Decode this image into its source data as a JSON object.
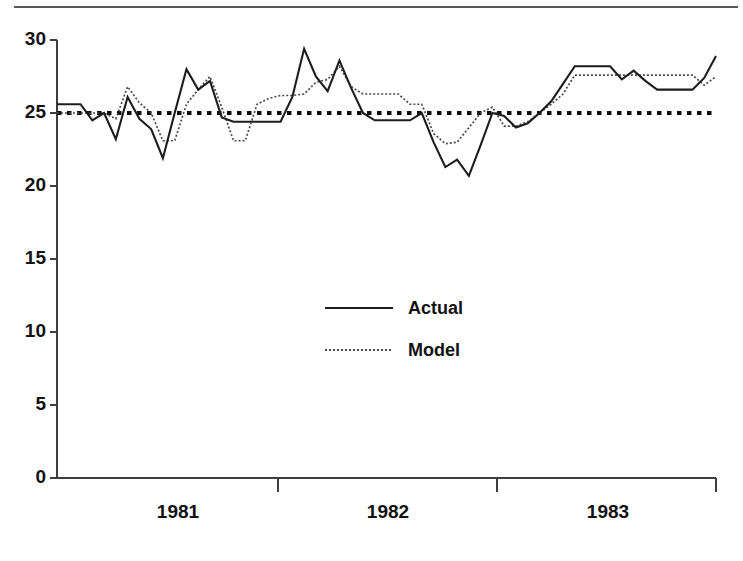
{
  "chart_data": {
    "type": "line",
    "title": "",
    "subtitle": "",
    "xlabel": "",
    "ylabel": "",
    "ylim": [
      0,
      30
    ],
    "yticks": [
      0,
      5,
      10,
      15,
      20,
      25,
      30
    ],
    "ytick_labels": [
      "0",
      "5",
      "10",
      "15",
      "20",
      "25",
      "30"
    ],
    "xtick_labels": [
      "1981",
      "1982",
      "1983"
    ],
    "x_axis_note": "monthly observations spanning late 1980 through early 1984; year tick marks delimit 1981, 1982, 1983",
    "grid": false,
    "legend_position": "center",
    "reference_line": {
      "name": "reference-level",
      "value": 25,
      "style": "dotted-heavy"
    },
    "series": [
      {
        "name": "Actual",
        "style": "solid",
        "color": "#1d1d1d",
        "values": [
          25.6,
          25.6,
          25.6,
          24.5,
          25.0,
          23.2,
          26.1,
          24.6,
          23.9,
          21.9,
          25.0,
          28.0,
          26.6,
          27.2,
          24.7,
          24.4,
          24.4,
          24.4,
          24.4,
          24.4,
          26.1,
          29.4,
          27.5,
          26.5,
          28.6,
          26.7,
          25.0,
          24.5,
          24.5,
          24.5,
          24.5,
          25.0,
          23.0,
          21.3,
          21.8,
          20.7,
          22.8,
          25.0,
          24.8,
          24.0,
          24.3,
          25.0,
          25.8,
          27.0,
          28.2,
          28.2,
          28.2,
          28.2,
          27.3,
          27.9,
          27.2,
          26.6,
          26.6,
          26.6,
          26.6,
          27.4,
          28.9
        ]
      },
      {
        "name": "Model",
        "style": "dotted",
        "color": "#4a4a4a",
        "values": [
          25.0,
          25.0,
          25.0,
          25.0,
          25.0,
          24.6,
          26.8,
          25.7,
          25.0,
          23.1,
          23.1,
          25.6,
          26.6,
          27.5,
          25.4,
          23.1,
          23.1,
          25.6,
          26.0,
          26.2,
          26.2,
          26.3,
          27.1,
          27.3,
          28.2,
          26.8,
          26.3,
          26.3,
          26.3,
          26.3,
          25.6,
          25.6,
          23.6,
          22.9,
          23.0,
          24.0,
          25.0,
          25.4,
          24.1,
          24.1,
          24.4,
          25.0,
          25.6,
          26.3,
          27.6,
          27.6,
          27.6,
          27.6,
          27.6,
          27.6,
          27.6,
          27.6,
          27.6,
          27.6,
          27.6,
          26.9,
          27.5
        ]
      }
    ],
    "legend_entries": [
      {
        "label": "Actual",
        "style": "solid"
      },
      {
        "label": "Model",
        "style": "dotted"
      }
    ]
  },
  "legend": {
    "actual_label": "Actual",
    "model_label": "Model"
  },
  "axes": {
    "y_labels": [
      "30",
      "25",
      "20",
      "15",
      "10",
      "5",
      "0"
    ],
    "x_labels": [
      "1981",
      "1982",
      "1983"
    ]
  }
}
